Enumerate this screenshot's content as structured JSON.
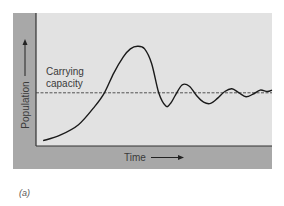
{
  "panel_label": "(a)",
  "colors": {
    "frame_band": "#a8a8a8",
    "plot_bg": "#e2e2e2",
    "axis": "#333333",
    "curve": "#1a1a1a",
    "capacity_line": "#444444",
    "text": "#3a3a3a"
  },
  "chart_data": {
    "type": "line",
    "title": "",
    "xlabel": "Time",
    "ylabel": "Population",
    "xlim": [
      0,
      100
    ],
    "ylim": [
      0,
      100
    ],
    "grid": false,
    "ticks": "none",
    "annotations": [
      {
        "text_lines": [
          "Carrying",
          "capacity"
        ],
        "refers_to": "carrying-capacity-line"
      }
    ],
    "reference_lines": [
      {
        "name": "Carrying capacity",
        "y": 40,
        "style": "dashed"
      }
    ],
    "series": [
      {
        "name": "Population",
        "x": [
          3,
          10,
          18,
          25,
          29,
          33,
          37,
          40,
          43,
          46,
          49,
          52,
          55,
          57,
          59,
          62,
          65,
          68,
          71,
          74,
          77,
          80,
          83,
          86,
          89,
          92,
          95,
          98,
          100
        ],
        "y": [
          4,
          8,
          16,
          30,
          40,
          55,
          67,
          73,
          75,
          73,
          62,
          40,
          30,
          32,
          38,
          46,
          45,
          38,
          33,
          32,
          36,
          41,
          43,
          40,
          37,
          39,
          42,
          41,
          42
        ]
      }
    ]
  }
}
